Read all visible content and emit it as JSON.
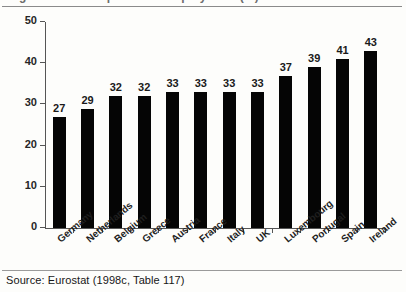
{
  "figure": {
    "title_clipped": "Figure: Share of part-time employment (%)",
    "source": "Source: Eurostat (1998c, Table 117)"
  },
  "chart_data": {
    "type": "bar",
    "title": "",
    "xlabel": "",
    "ylabel": "",
    "ylim": [
      0,
      50
    ],
    "yticks": [
      0,
      10,
      20,
      30,
      40,
      50
    ],
    "grid": false,
    "legend": null,
    "orientation": "vertical",
    "bar_color": "#050505",
    "categories": [
      "Germany",
      "Netherlands",
      "Belgium",
      "Greece",
      "Austria",
      "France",
      "Italy",
      "UK",
      "Luxembourg",
      "Portugal",
      "Spain",
      "Ireland"
    ],
    "values": [
      27,
      29,
      32,
      32,
      33,
      33,
      33,
      33,
      37,
      39,
      41,
      43
    ],
    "data_labels": [
      "27",
      "29",
      "32",
      "32",
      "33",
      "33",
      "33",
      "33",
      "37",
      "39",
      "41",
      "43"
    ],
    "ytick_labels": [
      "0",
      "10",
      "20",
      "30",
      "40",
      "50"
    ]
  }
}
